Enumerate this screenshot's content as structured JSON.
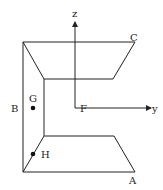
{
  "diagram": {
    "type": "3d-geometry-figure",
    "axes": {
      "z_label": "z",
      "y_label": "y"
    },
    "points": {
      "A": "A",
      "B": "B",
      "C": "C",
      "F": "F",
      "G": "G",
      "H": "H"
    },
    "colors": {
      "stroke": "#222222",
      "background": "#ffffff"
    }
  }
}
